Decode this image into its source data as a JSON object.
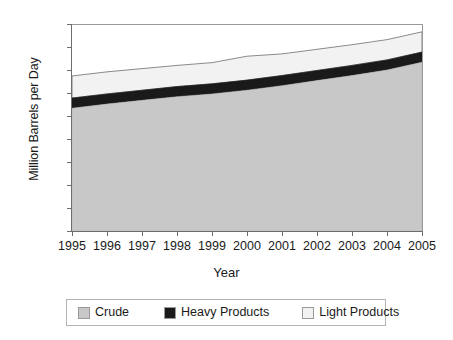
{
  "chart_data": {
    "type": "area",
    "stacked": true,
    "title": "",
    "xlabel": "Year",
    "ylabel": "Million Barrels per Day",
    "x": [
      1995,
      1996,
      1997,
      1998,
      1999,
      2000,
      2001,
      2002,
      2003,
      2004,
      2005
    ],
    "categories": [
      "1995",
      "1996",
      "1997",
      "1998",
      "1999",
      "2000",
      "2001",
      "2002",
      "2003",
      "2004",
      "2005"
    ],
    "series": [
      {
        "name": "Crude",
        "color": "#c8c8c8",
        "values": [
          26.7,
          27.6,
          28.4,
          29.2,
          29.8,
          30.6,
          31.6,
          32.7,
          33.8,
          35.0,
          36.7
        ]
      },
      {
        "name": "Heavy Products",
        "color": "#1a1a1a",
        "values": [
          2.2,
          2.2,
          2.2,
          2.2,
          2.2,
          2.2,
          2.2,
          2.2,
          2.2,
          2.2,
          2.2
        ]
      },
      {
        "name": "Light Products",
        "color": "#f2f2f2",
        "values": [
          4.8,
          4.8,
          4.7,
          4.6,
          4.6,
          5.2,
          4.7,
          4.6,
          4.5,
          4.4,
          4.4
        ]
      }
    ],
    "cumulative_tops": {
      "crude": [
        26.7,
        27.6,
        28.4,
        29.2,
        29.8,
        30.6,
        31.6,
        32.7,
        33.8,
        35.0,
        36.7
      ],
      "heavy_products": [
        28.9,
        29.8,
        30.6,
        31.4,
        32.0,
        32.8,
        33.8,
        34.9,
        36.0,
        37.2,
        38.9
      ],
      "light_products": [
        33.7,
        34.6,
        35.3,
        36.0,
        36.6,
        38.0,
        38.5,
        39.5,
        40.5,
        41.6,
        43.3
      ]
    },
    "ylim": [
      0,
      45
    ],
    "yticks": [
      0,
      5,
      10,
      15,
      20,
      25,
      30,
      35,
      40,
      45
    ],
    "ytick_labels": [
      "0",
      "5",
      "10",
      "15",
      "20",
      "25",
      "30",
      "35",
      "40",
      "45"
    ],
    "xlim": [
      1995,
      2005
    ],
    "grid": false,
    "legend_position": "bottom",
    "legend_entries": [
      {
        "label": "Crude",
        "color": "#c8c8c8",
        "swatch": "crude-swatch-icon"
      },
      {
        "label": "Heavy Products",
        "color": "#1a1a1a",
        "swatch": "heavy-products-swatch-icon"
      },
      {
        "label": "Light Products",
        "color": "#f2f2f2",
        "swatch": "light-products-swatch-icon"
      }
    ]
  },
  "axes": {
    "y_title": "Million Barrels per Day",
    "x_title": "Year"
  }
}
